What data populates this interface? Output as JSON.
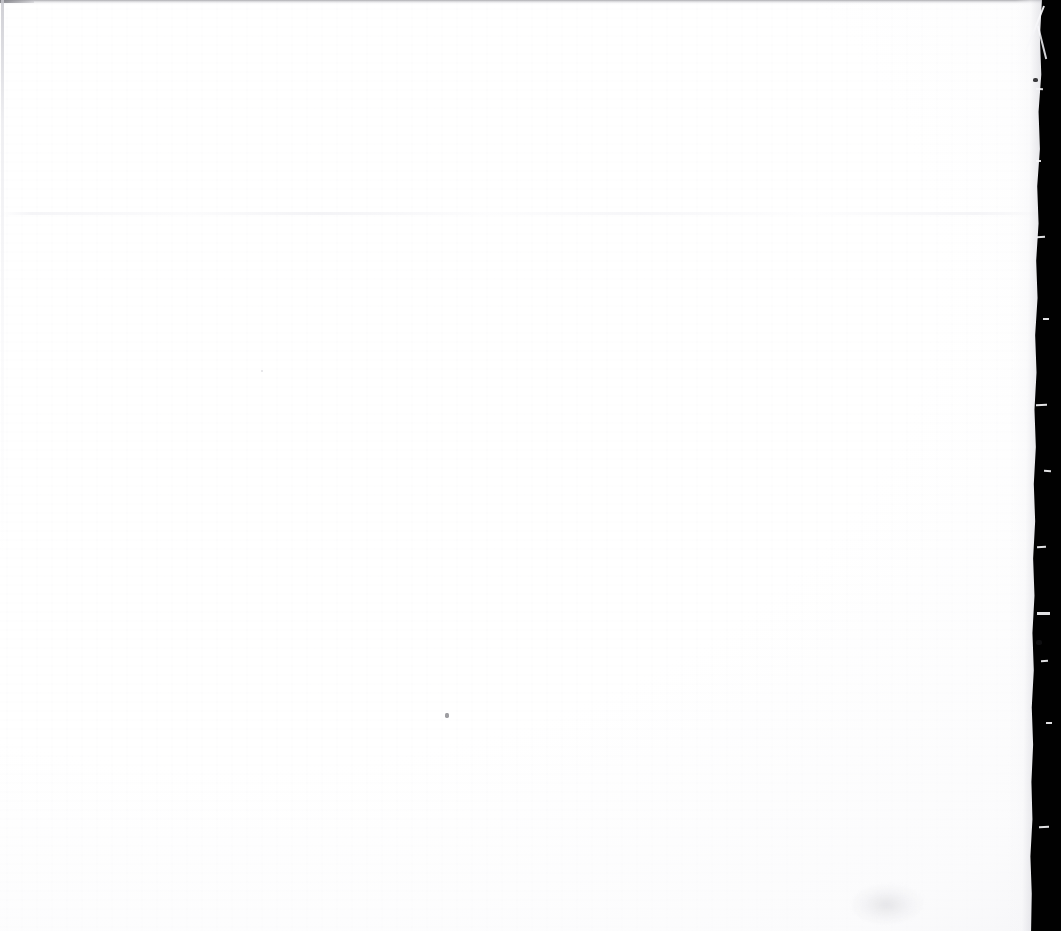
{
  "document": {
    "page_kind": "blank-scanned-page",
    "page_text": "",
    "visible_text_lines": [],
    "headings": [],
    "page_number_label": "",
    "caption": ""
  },
  "scan": {
    "canvas_width": 1061,
    "canvas_height": 931,
    "paper_color": "#ffffff",
    "paper_tint_color": "#fdfdfd",
    "scanner_bed_color": "#010101",
    "edge_shadow_color": "#a8a8ac",
    "crease_color": "#f2f2f5",
    "speck_color": "#8d8d92",
    "smudge_color": "#d4d4d9"
  },
  "artifacts": {
    "right_border": {
      "name": "scanner-bed-black-border",
      "edge_x_top": 1048,
      "edge_x_bottom": 1034,
      "color": "#010101"
    },
    "top_edge": {
      "name": "top-edge-shadow-line",
      "y": 0,
      "height": 5
    },
    "left_edge": {
      "name": "left-edge-faint-line",
      "x": 1,
      "height": 560
    },
    "fold_crease": {
      "name": "horizontal-fold-crease",
      "y": 213
    },
    "dust_speck": {
      "name": "dust-speck",
      "x": 445,
      "y": 713
    },
    "smudge": {
      "name": "bottom-right-smudge",
      "x": 870,
      "y": 902
    }
  }
}
